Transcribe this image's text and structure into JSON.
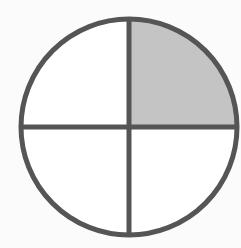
{
  "diagram": {
    "type": "fraction-circle",
    "parts": 4,
    "shaded_parts": 1,
    "shaded_quadrant": "top-right",
    "fraction": "1/4",
    "colors": {
      "background": "#fbfbfb",
      "outline": "#555555",
      "shaded": "#c4c4c4",
      "unshaded": "#ffffff"
    }
  }
}
